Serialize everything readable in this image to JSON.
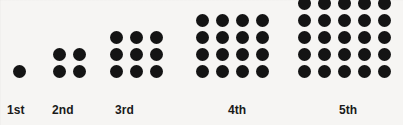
{
  "figure": {
    "background_color": "#f6f5f3",
    "dot_color": "#141414",
    "label_color": "#1a1a1a",
    "width": 403,
    "height": 125
  },
  "chart_data": {
    "type": "scatter",
    "xlabel": "",
    "ylabel": "",
    "categories": [
      "1st",
      "2nd",
      "3rd",
      "4th",
      "5th"
    ],
    "values": [
      1,
      4,
      9,
      16,
      25
    ],
    "series": [
      {
        "name": "dots per term",
        "values": [
          1,
          4,
          9,
          16,
          25
        ]
      },
      {
        "name": "grid rows",
        "values": [
          1,
          2,
          3,
          4,
          5
        ]
      },
      {
        "name": "grid columns",
        "values": [
          1,
          2,
          3,
          4,
          5
        ]
      }
    ],
    "grid": false,
    "legend": "none",
    "annotations": []
  },
  "terms": [
    {
      "label": "1st",
      "rows": 1,
      "cols": 1,
      "count": 1,
      "group_left": 9,
      "group_bottom": 80,
      "label_left": 7,
      "label_top": 103
    },
    {
      "label": "2nd",
      "rows": 2,
      "cols": 2,
      "count": 4,
      "group_left": 49,
      "group_bottom": 80,
      "label_left": 52,
      "label_top": 103
    },
    {
      "label": "3rd",
      "rows": 3,
      "cols": 3,
      "count": 9,
      "group_left": 106,
      "group_bottom": 80,
      "label_left": 115,
      "label_top": 103
    },
    {
      "label": "4th",
      "rows": 4,
      "cols": 4,
      "count": 16,
      "group_left": 192,
      "group_bottom": 80,
      "label_left": 228,
      "label_top": 103
    },
    {
      "label": "5th",
      "rows": 5,
      "cols": 5,
      "count": 25,
      "group_left": 294,
      "group_bottom": 80,
      "label_left": 339,
      "label_top": 103
    }
  ],
  "geometry": {
    "dot_diameter": 13,
    "pitch_x": 20,
    "pitch_y": 17
  }
}
